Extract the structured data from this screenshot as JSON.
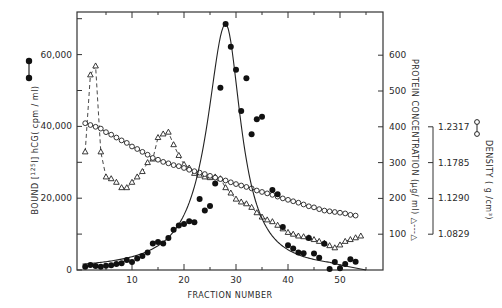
{
  "chart_data": {
    "type": "line",
    "title": "",
    "xlabel": "FRACTION NUMBER",
    "x_ticks": [
      10,
      20,
      30,
      40,
      50
    ],
    "xlim": [
      0,
      58
    ],
    "left_axis": {
      "label": "BOUND [125I]hCG (cpm / ml)",
      "label_parts": {
        "prefix": "BOUND",
        "iso": "125",
        "element": "I",
        "suffix": "hCG( cpm / ml)"
      },
      "ticks": [
        "0",
        "20,000",
        "40,000",
        "60,000"
      ],
      "tick_values": [
        0,
        20000,
        40000,
        60000
      ],
      "ylim": [
        0,
        72000
      ],
      "legend_symbol": "filled-circle-line"
    },
    "right_axis": {
      "label": "PROTEIN CONCENTRATION (µg/ ml) △---△",
      "ticks": [
        "100",
        "200",
        "300",
        "400",
        "500",
        "600"
      ],
      "tick_values": [
        100,
        200,
        300,
        400,
        500,
        600
      ],
      "ylim": [
        0,
        720
      ]
    },
    "density_axis": {
      "label": "DENSITY ( g /cm³)",
      "ticks": [
        "1.2317",
        "1.1785",
        "1.1290",
        "1.0829"
      ],
      "tick_protein_equiv": [
        400,
        300,
        200,
        100
      ],
      "legend_symbol": "open-circle-line"
    },
    "grid": false,
    "series": [
      {
        "name": "Bound [125I]hCG (cpm/ml)",
        "marker": "filled-circle",
        "axis": "left",
        "points": [
          [
            1,
            900
          ],
          [
            2,
            1400
          ],
          [
            3,
            1100
          ],
          [
            4,
            900
          ],
          [
            5,
            1200
          ],
          [
            6,
            1300
          ],
          [
            7,
            1700
          ],
          [
            8,
            1900
          ],
          [
            9,
            2800
          ],
          [
            10,
            2200
          ],
          [
            11,
            3200
          ],
          [
            12,
            3900
          ],
          [
            13,
            4900
          ],
          [
            14,
            7400
          ],
          [
            15,
            7800
          ],
          [
            16,
            7400
          ],
          [
            17,
            8900
          ],
          [
            18,
            11200
          ],
          [
            19,
            12400
          ],
          [
            20,
            12800
          ],
          [
            21,
            13600
          ],
          [
            22,
            13300
          ],
          [
            23,
            19800
          ],
          [
            24,
            16600
          ],
          [
            25,
            17800
          ],
          [
            26,
            24100
          ],
          [
            27,
            50800
          ],
          [
            28,
            68500
          ],
          [
            29,
            62200
          ],
          [
            30,
            55800
          ],
          [
            31,
            44300
          ],
          [
            32,
            53400
          ],
          [
            33,
            37800
          ],
          [
            34,
            42000
          ],
          [
            35,
            42700
          ],
          [
            37,
            22300
          ],
          [
            38,
            21100
          ],
          [
            39,
            12000
          ],
          [
            40,
            6900
          ],
          [
            41,
            6000
          ],
          [
            42,
            4900
          ],
          [
            43,
            4700
          ],
          [
            44,
            8900
          ],
          [
            45,
            4600
          ],
          [
            46,
            3400
          ],
          [
            47,
            7300
          ],
          [
            48,
            300
          ],
          [
            49,
            2200
          ],
          [
            50,
            500
          ],
          [
            51,
            1700
          ],
          [
            52,
            3000
          ],
          [
            53,
            2300
          ]
        ],
        "fit_curve": "gaussian/lorentzian peak at fraction 28, ~68,000 cpm"
      },
      {
        "name": "Protein concentration (µg/ml)",
        "marker": "open-triangle",
        "line": "dashed",
        "axis": "right",
        "points": [
          [
            1,
            330
          ],
          [
            2,
            545
          ],
          [
            3,
            570
          ],
          [
            4,
            330
          ],
          [
            5,
            260
          ],
          [
            6,
            255
          ],
          [
            7,
            245
          ],
          [
            8,
            230
          ],
          [
            9,
            230
          ],
          [
            10,
            245
          ],
          [
            11,
            260
          ],
          [
            12,
            275
          ],
          [
            13,
            300
          ],
          [
            14,
            310
          ],
          [
            15,
            370
          ],
          [
            16,
            380
          ],
          [
            17,
            385
          ],
          [
            18,
            350
          ],
          [
            19,
            320
          ],
          [
            20,
            295
          ],
          [
            21,
            285
          ],
          [
            22,
            270
          ],
          [
            23,
            265
          ],
          [
            24,
            260
          ],
          [
            25,
            258
          ],
          [
            26,
            260
          ],
          [
            27,
            255
          ],
          [
            28,
            230
          ],
          [
            29,
            215
          ],
          [
            30,
            198
          ],
          [
            31,
            190
          ],
          [
            32,
            185
          ],
          [
            33,
            175
          ],
          [
            34,
            160
          ],
          [
            35,
            148
          ],
          [
            36,
            140
          ],
          [
            37,
            135
          ],
          [
            38,
            125
          ],
          [
            39,
            115
          ],
          [
            40,
            105
          ],
          [
            41,
            100
          ],
          [
            42,
            95
          ],
          [
            43,
            93
          ],
          [
            44,
            90
          ],
          [
            45,
            85
          ],
          [
            46,
            80
          ],
          [
            47,
            75
          ],
          [
            48,
            68
          ],
          [
            49,
            62
          ],
          [
            50,
            70
          ],
          [
            51,
            80
          ],
          [
            52,
            85
          ],
          [
            53,
            90
          ],
          [
            54,
            95
          ]
        ]
      },
      {
        "name": "Density (g/cm3)",
        "marker": "open-circle",
        "axis": "right",
        "points": [
          [
            1,
            410
          ],
          [
            2,
            405
          ],
          [
            3,
            400
          ],
          [
            4,
            395
          ],
          [
            5,
            385
          ],
          [
            6,
            378
          ],
          [
            7,
            370
          ],
          [
            8,
            362
          ],
          [
            9,
            355
          ],
          [
            10,
            345
          ],
          [
            11,
            338
          ],
          [
            12,
            330
          ],
          [
            13,
            322
          ],
          [
            14,
            313
          ],
          [
            15,
            308
          ],
          [
            16,
            302
          ],
          [
            17,
            298
          ],
          [
            18,
            293
          ],
          [
            19,
            290
          ],
          [
            20,
            285
          ],
          [
            21,
            280
          ],
          [
            22,
            276
          ],
          [
            23,
            272
          ],
          [
            24,
            268
          ],
          [
            25,
            263
          ],
          [
            26,
            258
          ],
          [
            27,
            254
          ],
          [
            28,
            250
          ],
          [
            29,
            245
          ],
          [
            30,
            240
          ],
          [
            31,
            236
          ],
          [
            32,
            232
          ],
          [
            33,
            228
          ],
          [
            34,
            222
          ],
          [
            35,
            218
          ],
          [
            36,
            214
          ],
          [
            37,
            210
          ],
          [
            38,
            205
          ],
          [
            39,
            200
          ],
          [
            40,
            196
          ],
          [
            41,
            192
          ],
          [
            42,
            188
          ],
          [
            43,
            183
          ],
          [
            44,
            178
          ],
          [
            45,
            175
          ],
          [
            46,
            170
          ],
          [
            47,
            166
          ],
          [
            48,
            164
          ],
          [
            49,
            162
          ],
          [
            50,
            160
          ],
          [
            51,
            158
          ],
          [
            52,
            154
          ],
          [
            53,
            152
          ]
        ]
      }
    ]
  }
}
